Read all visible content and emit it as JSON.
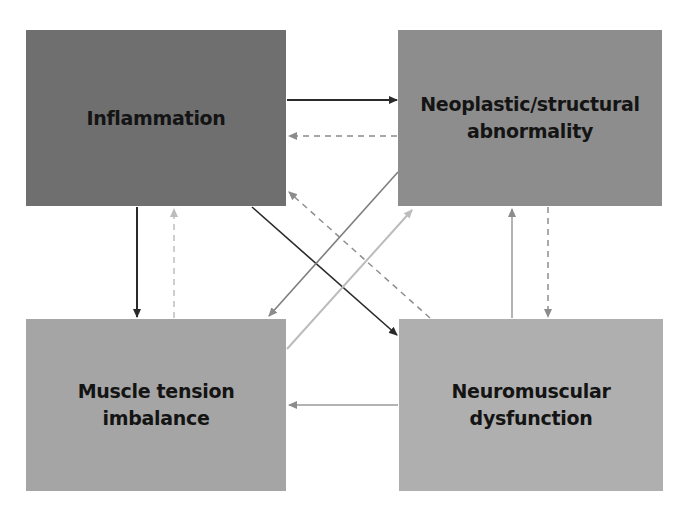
{
  "diagram": {
    "nodes": [
      {
        "id": "inflammation",
        "lines": [
          "Inflammation"
        ],
        "color": "#6f6f6f",
        "x": 26,
        "y": 30,
        "w": 260,
        "h": 176
      },
      {
        "id": "neoplastic",
        "lines": [
          "Neoplastic/structural",
          "abnormality"
        ],
        "color": "#8d8d8d",
        "x": 398,
        "y": 30,
        "w": 264,
        "h": 176
      },
      {
        "id": "muscle_tension",
        "lines": [
          "Muscle tension",
          "imbalance"
        ],
        "color": "#a5a5a5",
        "x": 26,
        "y": 319,
        "w": 260,
        "h": 172
      },
      {
        "id": "neuromuscular",
        "lines": [
          "Neuromuscular",
          "dysfunction"
        ],
        "color": "#afafaf",
        "x": 399,
        "y": 319,
        "w": 264,
        "h": 172
      }
    ],
    "edges": [
      {
        "from": "inflammation",
        "to": "neoplastic",
        "style": "solid",
        "color": "#2a2a2a"
      },
      {
        "from": "neoplastic",
        "to": "inflammation",
        "style": "dashed",
        "color": "#8a8a8a"
      },
      {
        "from": "inflammation",
        "to": "muscle_tension",
        "style": "solid",
        "color": "#2a2a2a"
      },
      {
        "from": "muscle_tension",
        "to": "inflammation",
        "style": "dashed",
        "color": "#bdbdbd"
      },
      {
        "from": "inflammation",
        "to": "neuromuscular",
        "style": "solid",
        "color": "#2a2a2a"
      },
      {
        "from": "neuromuscular",
        "to": "inflammation",
        "style": "dashed",
        "color": "#8f8f8f"
      },
      {
        "from": "neoplastic",
        "to": "muscle_tension",
        "style": "solid",
        "color": "#7e7e7e"
      },
      {
        "from": "muscle_tension",
        "to": "neoplastic",
        "style": "solid",
        "color": "#bcbcbc"
      },
      {
        "from": "neoplastic",
        "to": "neuromuscular",
        "style": "dashed",
        "color": "#8f8f8f"
      },
      {
        "from": "neuromuscular",
        "to": "neoplastic",
        "style": "solid",
        "color": "#9a9a9a"
      },
      {
        "from": "neuromuscular",
        "to": "muscle_tension",
        "style": "solid",
        "color": "#9a9a9a"
      }
    ]
  }
}
